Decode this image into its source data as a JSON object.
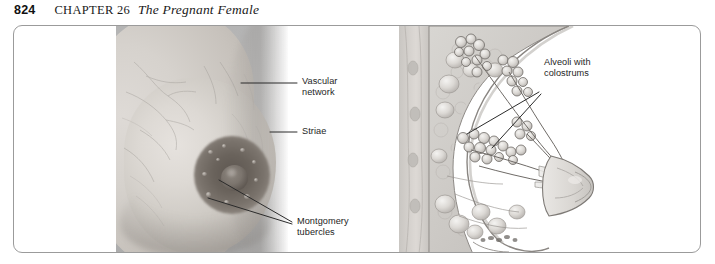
{
  "running_head": {
    "folio": "824",
    "chapter_label": "CHAPTER 26",
    "chapter_title": "The Pregnant Female"
  },
  "figure": {
    "frame_color": "#9b9b9b",
    "panels": [
      {
        "id": "photograph",
        "name": "breast-photograph",
        "description": "Grayscale lateral photograph of a pregnant breast"
      },
      {
        "id": "illustration",
        "name": "breast-cross-section-illustration",
        "description": "Sagittal cross-section drawing of lactating breast with alveoli, ducts and nipple"
      }
    ],
    "labels": [
      {
        "id": "vascular-network",
        "lines": [
          "Vascular",
          "network"
        ],
        "text": "Vascular network"
      },
      {
        "id": "striae",
        "lines": [
          "Striae"
        ],
        "text": "Striae"
      },
      {
        "id": "montgomery-tubercles",
        "lines": [
          "Montgomery",
          "tubercles"
        ],
        "text": "Montgomery tubercles"
      },
      {
        "id": "alveoli-with-colostrums",
        "lines": [
          "Alveoli with",
          "colostrums"
        ],
        "text": "Alveoli with colostrums"
      }
    ],
    "label_color": "#1e1e1e",
    "leader_line_color": "#2b2b2b"
  }
}
